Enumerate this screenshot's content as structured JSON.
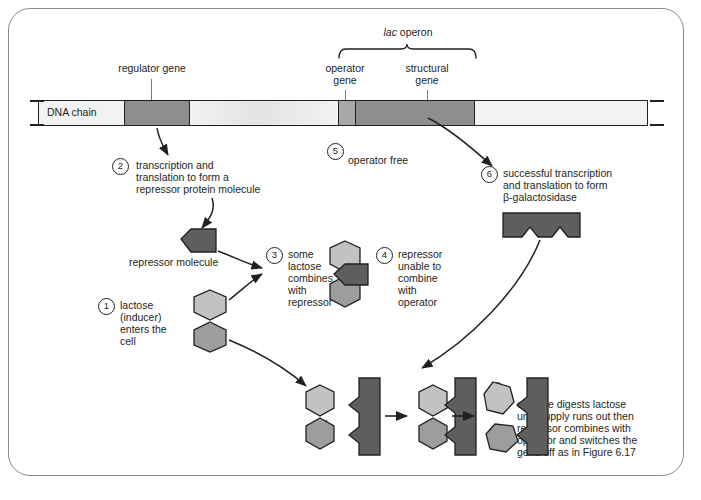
{
  "figure": {
    "title_labels": {
      "lac_operon_italic": "lac",
      "lac_operon_rest": " operon",
      "regulator_gene": "regulator gene",
      "operator_gene_l1": "operator",
      "operator_gene_l2": "gene",
      "structural_gene_l1": "structural",
      "structural_gene_l2": "gene",
      "dna_chain": "DNA chain"
    },
    "steps": [
      {
        "number": "1",
        "text_lines": [
          "lactose",
          "(inducer)",
          "enters the",
          "cell"
        ]
      },
      {
        "number": "2",
        "text_lines": [
          "transcription and",
          "translation to form a",
          "repressor protein molecule"
        ]
      },
      {
        "number": "3",
        "text_lines": [
          "some",
          "lactose",
          "combines",
          "with",
          "repressor"
        ]
      },
      {
        "number": "4",
        "text_lines": [
          "repressor",
          "unable to",
          "combine",
          "with",
          "operator"
        ]
      },
      {
        "number": "5",
        "text_lines": [
          "operator free"
        ]
      },
      {
        "number": "6",
        "text_lines": [
          "successful transcription",
          "and translation to form",
          "β-galactosidase"
        ]
      },
      {
        "number": "7",
        "text_lines": [
          "enzyme digests lactose",
          "until supply runs out then",
          "repressor combines with",
          "operator and switches the",
          "gene off as in Figure 6.17"
        ]
      }
    ],
    "molecule_labels": {
      "repressor_molecule": "repressor molecule",
      "plus_sign": "+"
    },
    "colors": {
      "dna_dark_segment": "#8e8e8e",
      "dna_mid_segment": "#a8a8a8",
      "dna_light_segment": "#f2f2f0",
      "lactose_upper": "#c2c2c2",
      "lactose_lower": "#9d9d9d",
      "repressor": "#5e5e5e",
      "enzyme": "#5e5e5e",
      "outline": "#231f20",
      "frame_border": "#8c8c8c",
      "leader_line": "#7a7a7a",
      "background": "#ffffff"
    }
  }
}
